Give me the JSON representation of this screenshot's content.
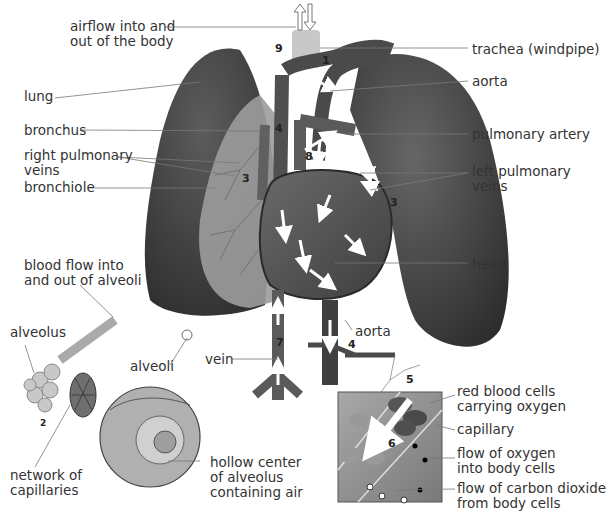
{
  "labels": {
    "airflow": [
      "airflow into and",
      "out of the body"
    ],
    "lung": "lung",
    "bronchus": "bronchus",
    "right_pulmonary_veins": [
      "right pulmonary",
      "veins"
    ],
    "bronchiole": "bronchiole",
    "trachea": "trachea (windpipe)",
    "aorta_top": "aorta",
    "pulmonary_artery": "pulmonary artery",
    "left_pulmonary_veins": [
      "left pulmonary",
      "veins"
    ],
    "heart": "heart",
    "blood_flow_alveoli": [
      "blood flow into",
      "and out of alveoli"
    ],
    "alveolus": "alveolus",
    "alveoli": "alveoli",
    "vein": "vein",
    "aorta_bottom": "aorta",
    "network_capillaries": [
      "network of",
      "capillaries"
    ],
    "hollow_center": [
      "hollow center",
      "of alveolus",
      "containing air"
    ],
    "red_blood_cells": [
      "red blood cells",
      "carrying oxygen"
    ],
    "capillary": "capillary",
    "flow_oxygen": [
      "flow of oxygen",
      "into body cells"
    ],
    "flow_co2": [
      "flow of carbon dioxide",
      "from body cells"
    ]
  },
  "step_numbers": {
    "n1": "1",
    "n2": "2",
    "n3a": "3",
    "n3b": "3",
    "n4a": "4",
    "n4b": "4",
    "n5": "5",
    "n6": "6",
    "n7": "7",
    "n8": "8",
    "n9": "9"
  },
  "colors": {
    "lung": "#4a4a4a",
    "lung_dark": "#2f2f2f",
    "tissue": "#9a9a9a",
    "heart": "#5a5a5a",
    "vessel": "#555555",
    "trachea": "#c8c8c8",
    "leader": "#555555",
    "text": "#333333",
    "arrow": "#ffffff"
  }
}
